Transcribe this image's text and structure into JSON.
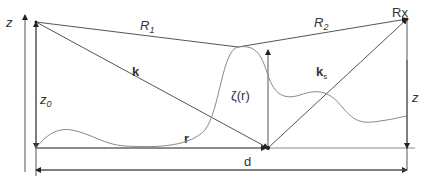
{
  "diagram": {
    "type": "scattering-geometry",
    "labels": {
      "z_axis": "z",
      "R1": "R",
      "R1_sub": "1",
      "R2": "R",
      "R2_sub": "2",
      "rx": "Rx",
      "k": "k",
      "ks": "k",
      "ks_sub": "s",
      "zeta": "ζ(r)",
      "z0": "z",
      "z0_sub": "0",
      "z_right": "z",
      "r": "r",
      "d": "d"
    },
    "colors": {
      "line": "#555555",
      "surface": "#888888",
      "text": "#333333",
      "background": "#ffffff"
    }
  }
}
